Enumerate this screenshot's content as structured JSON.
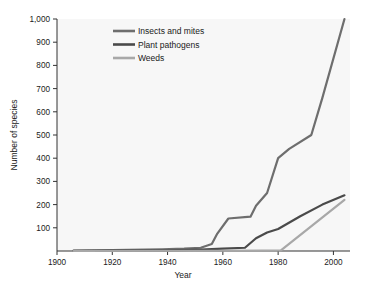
{
  "chart_data": {
    "type": "line",
    "title": "",
    "xlabel": "Year",
    "ylabel": "Number of species",
    "xlim": [
      1900,
      2006
    ],
    "ylim": [
      0,
      1000
    ],
    "grid": false,
    "legend_position": "top-left-inside",
    "xticks": [
      "1900",
      "1920",
      "1940",
      "1960",
      "1980",
      "2000"
    ],
    "xtick_values": [
      1900,
      1920,
      1940,
      1960,
      1980,
      2000
    ],
    "yticks": [
      "100",
      "200",
      "300",
      "400",
      "500",
      "600",
      "700",
      "800",
      "900",
      "1,000"
    ],
    "ytick_values": [
      100,
      200,
      300,
      400,
      500,
      600,
      700,
      800,
      900,
      1000
    ],
    "series": [
      {
        "name": "Insects and mites",
        "color": "#6e6e6e",
        "points": [
          [
            1906,
            2
          ],
          [
            1920,
            4
          ],
          [
            1938,
            7
          ],
          [
            1946,
            10
          ],
          [
            1952,
            14
          ],
          [
            1956,
            30
          ],
          [
            1958,
            75
          ],
          [
            1962,
            140
          ],
          [
            1970,
            148
          ],
          [
            1972,
            195
          ],
          [
            1976,
            250
          ],
          [
            1980,
            400
          ],
          [
            1984,
            440
          ],
          [
            1992,
            500
          ],
          [
            1996,
            660
          ],
          [
            2004,
            1000
          ]
        ]
      },
      {
        "name": "Plant pathogens",
        "color": "#4a4a4a",
        "points": [
          [
            1906,
            1
          ],
          [
            1940,
            3
          ],
          [
            1952,
            6
          ],
          [
            1960,
            10
          ],
          [
            1968,
            14
          ],
          [
            1972,
            55
          ],
          [
            1976,
            80
          ],
          [
            1980,
            95
          ],
          [
            1988,
            150
          ],
          [
            1996,
            200
          ],
          [
            2004,
            240
          ]
        ]
      },
      {
        "name": "Weeds",
        "color": "#a8a8a8",
        "points": [
          [
            1906,
            0
          ],
          [
            1960,
            1
          ],
          [
            1974,
            2
          ],
          [
            1981,
            3
          ],
          [
            2004,
            220
          ]
        ]
      }
    ]
  },
  "axes": {
    "x_title": "Year",
    "y_title": "Number of species"
  }
}
